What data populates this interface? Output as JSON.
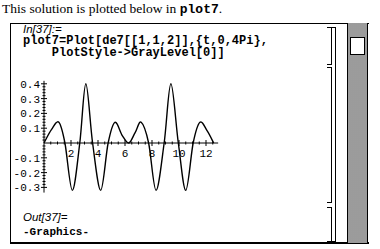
{
  "intro": {
    "text": "This solution is plotted below in ",
    "code": "plot7",
    "end": "."
  },
  "input_cell": {
    "label": "In[37]:=",
    "lines": [
      "plot7=Plot[de7[[1,1,2]],{t,0,4Pi},",
      "    PlotStyle->GrayLevel[0]]"
    ]
  },
  "output_cell": {
    "label": "Out[37]=",
    "value": "-Graphics-"
  },
  "chart_data": {
    "type": "line",
    "title": "",
    "xlabel": "t",
    "ylabel": "",
    "xlim": [
      0,
      12.566
    ],
    "ylim": [
      -0.33,
      0.42
    ],
    "x_ticks": [
      2,
      4,
      6,
      8,
      10,
      12
    ],
    "y_ticks": [
      -0.3,
      -0.2,
      -0.1,
      0.1,
      0.2,
      0.3,
      0.4
    ],
    "grid": false,
    "series": [
      {
        "name": "de7[[1,1,2]]",
        "color": "#000000",
        "x": [
          0,
          0.55,
          1.1,
          1.55,
          2.1,
          2.65,
          3.1,
          3.6,
          4.2,
          4.75,
          5.25,
          5.8,
          6.28,
          6.75,
          7.2,
          7.75,
          8.3,
          8.9,
          9.4,
          9.95,
          10.5,
          11.05,
          11.55,
          12.1,
          12.566
        ],
        "values": [
          0,
          0.09,
          0.14,
          0,
          -0.32,
          0,
          0.4,
          0,
          -0.32,
          0,
          0.14,
          0.05,
          0,
          0.07,
          0.14,
          0,
          -0.32,
          0,
          0.4,
          0,
          -0.32,
          0,
          0.14,
          0.08,
          0
        ]
      }
    ]
  }
}
